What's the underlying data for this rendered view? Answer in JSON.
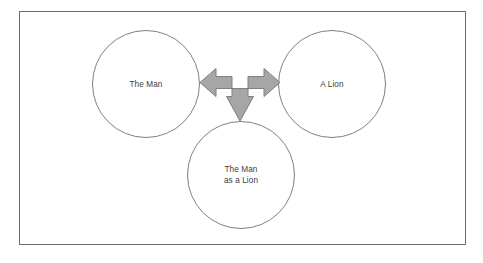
{
  "diagram": {
    "type": "concept-relationship",
    "frame": {
      "present": true,
      "border_color": "#6b6b6b",
      "background_color": "#ffffff"
    },
    "nodes": [
      {
        "id": "the-man",
        "label": "The Man",
        "shape": "circle",
        "position": "left",
        "stroke_color": "#7f7f7f",
        "fill_color": "#ffffff"
      },
      {
        "id": "a-lion",
        "label": "A Lion",
        "shape": "circle",
        "position": "right",
        "stroke_color": "#7f7f7f",
        "fill_color": "#ffffff"
      },
      {
        "id": "the-man-as-a-lion",
        "label": "The Man\nas a Lion",
        "shape": "circle",
        "position": "bottom",
        "stroke_color": "#7f7f7f",
        "fill_color": "#ffffff"
      }
    ],
    "connector": {
      "id": "tri-directional-arrow",
      "icon": "tri-directional-arrow-icon",
      "directions": [
        "left",
        "right",
        "down"
      ],
      "fill_color": "#a6a6a6",
      "stroke_color": "#7f7f7f",
      "connects": [
        "the-man",
        "a-lion",
        "the-man-as-a-lion"
      ]
    },
    "text_color": "#3b3b3b"
  }
}
